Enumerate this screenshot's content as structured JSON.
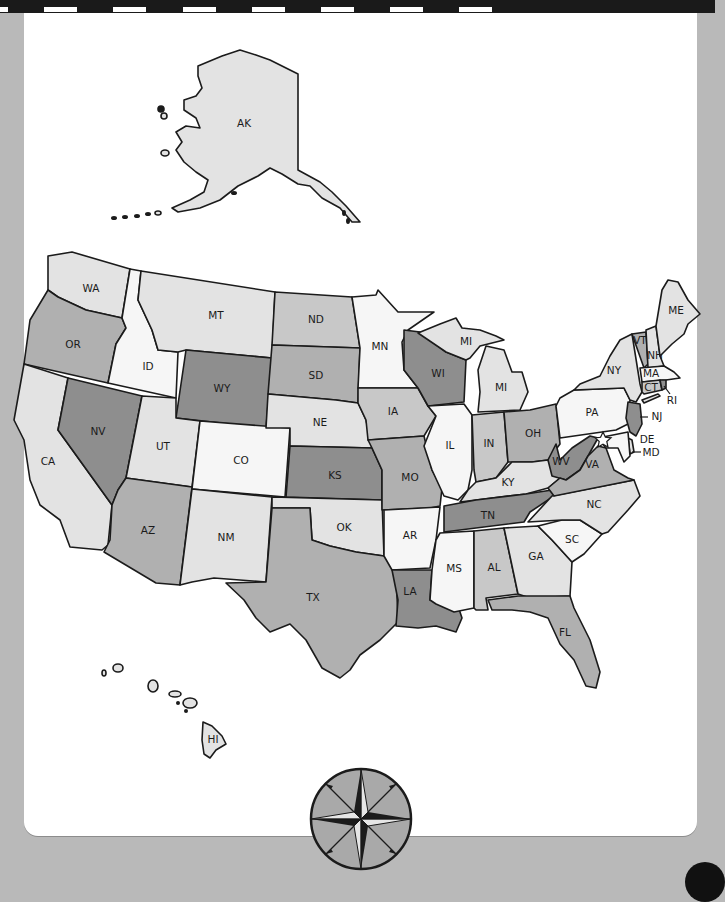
{
  "frame": {
    "background_color": "#b9b9b9",
    "panel_color": "#ffffff",
    "top_strip_color": "#1a1a1a"
  },
  "palette": {
    "white": "#f6f6f6",
    "light": "#e3e3e3",
    "mid": "#c8c8c8",
    "medium": "#b0b0b0",
    "dark": "#8e8e8e"
  },
  "map": {
    "title": "",
    "capital_marker": "star-icon",
    "states": [
      {
        "code": "AK",
        "label": "AK",
        "shade": "light"
      },
      {
        "code": "HI",
        "label": "HI",
        "shade": "light"
      },
      {
        "code": "WA",
        "label": "WA",
        "shade": "light"
      },
      {
        "code": "OR",
        "label": "OR",
        "shade": "medium"
      },
      {
        "code": "CA",
        "label": "CA",
        "shade": "light"
      },
      {
        "code": "ID",
        "label": "ID",
        "shade": "white"
      },
      {
        "code": "NV",
        "label": "NV",
        "shade": "dark"
      },
      {
        "code": "MT",
        "label": "MT",
        "shade": "light"
      },
      {
        "code": "WY",
        "label": "WY",
        "shade": "dark"
      },
      {
        "code": "UT",
        "label": "UT",
        "shade": "light"
      },
      {
        "code": "AZ",
        "label": "AZ",
        "shade": "medium"
      },
      {
        "code": "CO",
        "label": "CO",
        "shade": "white"
      },
      {
        "code": "NM",
        "label": "NM",
        "shade": "light"
      },
      {
        "code": "ND",
        "label": "ND",
        "shade": "mid"
      },
      {
        "code": "SD",
        "label": "SD",
        "shade": "medium"
      },
      {
        "code": "NE",
        "label": "NE",
        "shade": "light"
      },
      {
        "code": "KS",
        "label": "KS",
        "shade": "dark"
      },
      {
        "code": "OK",
        "label": "OK",
        "shade": "light"
      },
      {
        "code": "TX",
        "label": "TX",
        "shade": "medium"
      },
      {
        "code": "MN",
        "label": "MN",
        "shade": "white"
      },
      {
        "code": "IA",
        "label": "IA",
        "shade": "mid"
      },
      {
        "code": "MO",
        "label": "MO",
        "shade": "medium"
      },
      {
        "code": "AR",
        "label": "AR",
        "shade": "white"
      },
      {
        "code": "LA",
        "label": "LA",
        "shade": "dark"
      },
      {
        "code": "WI",
        "label": "WI",
        "shade": "dark"
      },
      {
        "code": "IL",
        "label": "IL",
        "shade": "white"
      },
      {
        "code": "MI",
        "label": "MI",
        "shade": "light"
      },
      {
        "code": "MI-UP",
        "label": "MI",
        "shade": "light"
      },
      {
        "code": "IN",
        "label": "IN",
        "shade": "mid"
      },
      {
        "code": "OH",
        "label": "OH",
        "shade": "medium"
      },
      {
        "code": "KY",
        "label": "KY",
        "shade": "light"
      },
      {
        "code": "TN",
        "label": "TN",
        "shade": "dark"
      },
      {
        "code": "MS",
        "label": "MS",
        "shade": "white"
      },
      {
        "code": "AL",
        "label": "AL",
        "shade": "mid"
      },
      {
        "code": "GA",
        "label": "GA",
        "shade": "light"
      },
      {
        "code": "FL",
        "label": "FL",
        "shade": "medium"
      },
      {
        "code": "SC",
        "label": "SC",
        "shade": "white"
      },
      {
        "code": "NC",
        "label": "NC",
        "shade": "light"
      },
      {
        "code": "VA",
        "label": "VA",
        "shade": "medium"
      },
      {
        "code": "WV",
        "label": "WV",
        "shade": "dark"
      },
      {
        "code": "PA",
        "label": "PA",
        "shade": "white"
      },
      {
        "code": "NY",
        "label": "NY",
        "shade": "light"
      },
      {
        "code": "NJ",
        "label": "NJ",
        "shade": "dark"
      },
      {
        "code": "DE",
        "label": "DE",
        "shade": "light"
      },
      {
        "code": "MD",
        "label": "MD",
        "shade": "white"
      },
      {
        "code": "CT",
        "label": "CT",
        "shade": "mid"
      },
      {
        "code": "RI",
        "label": "RI",
        "shade": "dark"
      },
      {
        "code": "MA",
        "label": "MA",
        "shade": "white"
      },
      {
        "code": "VT",
        "label": "VT",
        "shade": "medium"
      },
      {
        "code": "NH",
        "label": "NH",
        "shade": "light"
      },
      {
        "code": "ME",
        "label": "ME",
        "shade": "light"
      }
    ],
    "callouts": [
      "NJ",
      "DE",
      "MD",
      "RI"
    ]
  },
  "compass": {
    "name": "compass-rose",
    "ring_color": "#a9a9a9"
  }
}
